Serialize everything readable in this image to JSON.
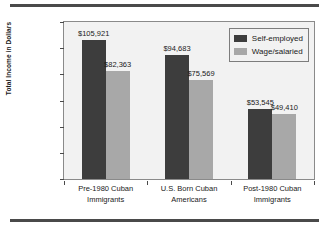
{
  "chart_data": {
    "type": "bar",
    "title": "",
    "xlabel": "",
    "ylabel": "Total Income in Dollars",
    "ylim": [
      0,
      120000
    ],
    "grid": false,
    "legend_position": "top-right",
    "categories": [
      "Pre-1980 Cuban Immigrants",
      "U.S. Born Cuban Americans",
      "Post-1980 Cuban Immigrants"
    ],
    "category_lines": [
      [
        "Pre-1980 Cuban",
        "Immigrants"
      ],
      [
        "U.S. Born Cuban",
        "Americans"
      ],
      [
        "Post-1980 Cuban",
        "Immigrants"
      ]
    ],
    "series": [
      {
        "name": "Self-employed",
        "color": "#3d3d3d",
        "values": [
          105921,
          94683,
          53545
        ],
        "labels": [
          "$105,921",
          "$94,683",
          "$53,545"
        ]
      },
      {
        "name": "Wage/salaried",
        "color": "#a8a8a8",
        "values": [
          82363,
          75569,
          49410
        ],
        "labels": [
          "$82,363",
          "$75,569",
          "$49,410"
        ]
      }
    ],
    "ytick_values": [
      0,
      20000,
      40000,
      60000,
      80000,
      100000,
      120000
    ],
    "ytick_labels": [
      "$0",
      "$20,000",
      "$40,000",
      "$60,000",
      "$80,000",
      "$100,000",
      "$120,000"
    ]
  },
  "axis": {
    "y_title": "Total Income in Dollars",
    "y_ticks": [
      "$120,000",
      "$100,000",
      "$80,000",
      "$60,000",
      "$40,000",
      "$20,000",
      "$0"
    ]
  },
  "legend": {
    "items": [
      {
        "label": "Self-employed"
      },
      {
        "label": "Wage/salaried"
      }
    ]
  },
  "groups": [
    {
      "line1": "Pre-1980 Cuban",
      "line2": "Immigrants",
      "self_label": "$105,921",
      "wage_label": "$82,363"
    },
    {
      "line1": "U.S. Born Cuban",
      "line2": "Americans",
      "self_label": "$94,683",
      "wage_label": "$75,569"
    },
    {
      "line1": "Post-1980 Cuban",
      "line2": "Immigrants",
      "self_label": "$53,545",
      "wage_label": "$49,410"
    }
  ]
}
